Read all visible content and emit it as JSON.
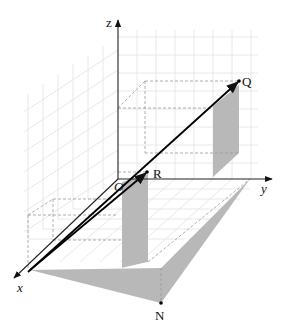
{
  "diagram": {
    "axes": {
      "x_label": "x",
      "y_label": "y",
      "z_label": "z",
      "origin_label": "O"
    },
    "points": {
      "Q": "Q",
      "R": "R",
      "N": "N"
    },
    "colors": {
      "shade": "#b8b8b8",
      "grid": "#e2e2e2",
      "dashed": "#9a9a9a",
      "vector": "#000000"
    }
  }
}
